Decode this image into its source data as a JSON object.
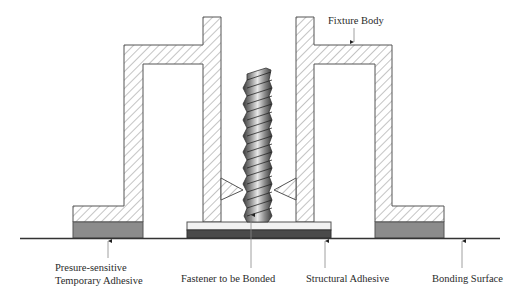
{
  "diagram": {
    "type": "cross-section",
    "colors": {
      "outline": "#555555",
      "hatch": "#8a8a8a",
      "temporary_adhesive": "#8c8c8c",
      "structural_adhesive": "#4a4a4a",
      "fastener_base": "#f2f2f2",
      "bonding_surface": "#333333",
      "screw_light": "#e8e8e8",
      "screw_dark": "#3a3a3a"
    },
    "labels": {
      "fixture_body": "Fixture Body",
      "temp_adhesive_line1": "Presure-sensitive",
      "temp_adhesive_line2": "Temporary Adhesive",
      "fastener": "Fastener to be Bonded",
      "structural_adhesive": "Structural Adhesive",
      "bonding_surface": "Bonding Surface"
    },
    "components": [
      {
        "name": "Fixture Body",
        "description": "Hatched sectioned fixture with two symmetric halves surrounding the fastener"
      },
      {
        "name": "Presure-sensitive Temporary Adhesive",
        "description": "Grey pads under fixture feet"
      },
      {
        "name": "Fastener to be Bonded",
        "description": "Threaded stud with flat base plate"
      },
      {
        "name": "Structural Adhesive",
        "description": "Dark layer under fastener base"
      },
      {
        "name": "Bonding Surface",
        "description": "Horizontal substrate line"
      }
    ]
  }
}
